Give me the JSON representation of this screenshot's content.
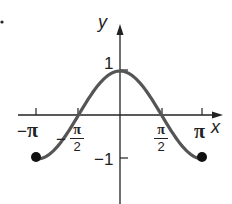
{
  "chart_data": {
    "type": "line",
    "title": "",
    "function": "y = cos(x)",
    "xlabel": "x",
    "ylabel": "y",
    "xlim": [
      -3.14159,
      3.14159
    ],
    "ylim": [
      -1,
      1
    ],
    "grid": false,
    "legend": null,
    "x_ticks": [
      {
        "value": -3.14159,
        "label": "−π"
      },
      {
        "value": -1.5708,
        "label": "−π/2"
      },
      {
        "value": 1.5708,
        "label": "π/2"
      },
      {
        "value": 3.14159,
        "label": "π"
      }
    ],
    "y_ticks": [
      {
        "value": 1,
        "label": "1"
      },
      {
        "value": -1,
        "label": "−1"
      }
    ],
    "x": [
      -3.14159,
      -2.35619,
      -1.5708,
      -0.7854,
      0,
      0.7854,
      1.5708,
      2.35619,
      3.14159
    ],
    "series": [
      {
        "name": "cos x",
        "values": [
          -1,
          -0.707,
          0,
          0.707,
          1,
          0.707,
          0,
          -0.707,
          -1
        ],
        "color": "#555555"
      }
    ],
    "endpoints": [
      {
        "x": -3.14159,
        "y": -1,
        "style": "closed"
      },
      {
        "x": 3.14159,
        "y": -1,
        "style": "closed"
      }
    ]
  },
  "labels": {
    "x_axis": "x",
    "y_axis": "y",
    "tick_neg_pi_sign": "−",
    "tick_pi": "π",
    "tick_half_num": "π",
    "tick_half_den": "2",
    "tick_neg_half_sign": "−",
    "tick_one": "1",
    "tick_neg_one": "−1"
  },
  "colors": {
    "curve": "#555555",
    "axes": "#222222",
    "background": "#ffffff"
  }
}
